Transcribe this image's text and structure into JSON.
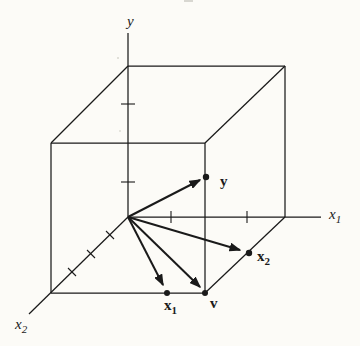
{
  "figure": {
    "name": "vectors-in-3d-cube-projection-figure",
    "background": "#fcfbf7",
    "ink": "#1a1a1a",
    "width": 360,
    "height": 346,
    "origin": {
      "x": 128,
      "y": 217
    },
    "axes": [
      {
        "name": "y-axis",
        "x1": 128,
        "y1": 217,
        "x2": 128,
        "y2": 33
      },
      {
        "name": "x1-axis",
        "x1": 128,
        "y1": 217,
        "x2": 321,
        "y2": 217
      },
      {
        "name": "x2-axis",
        "x1": 128,
        "y1": 217,
        "x2": 29,
        "y2": 314
      }
    ],
    "cube_edges": [
      {
        "name": "cube-back-top-edge",
        "x1": 128,
        "y1": 66,
        "x2": 285,
        "y2": 66
      },
      {
        "name": "cube-back-right-edge",
        "x1": 285,
        "y1": 66,
        "x2": 285,
        "y2": 217
      },
      {
        "name": "cube-top-left-receding-edge",
        "x1": 128,
        "y1": 66,
        "x2": 51,
        "y2": 143
      },
      {
        "name": "cube-top-right-receding-edge",
        "x1": 285,
        "y1": 66,
        "x2": 205,
        "y2": 143
      },
      {
        "name": "cube-front-top-edge",
        "x1": 51,
        "y1": 143,
        "x2": 205,
        "y2": 143
      },
      {
        "name": "cube-front-left-edge",
        "x1": 51,
        "y1": 143,
        "x2": 51,
        "y2": 293
      },
      {
        "name": "cube-front-right-edge",
        "x1": 205,
        "y1": 143,
        "x2": 205,
        "y2": 293
      },
      {
        "name": "cube-front-bottom-edge",
        "x1": 51,
        "y1": 293,
        "x2": 205,
        "y2": 293
      },
      {
        "name": "cube-bottom-right-receding-edge",
        "x1": 285,
        "y1": 217,
        "x2": 205,
        "y2": 293
      }
    ],
    "ticks": [
      {
        "name": "y-axis-tick-1",
        "x1": 121,
        "y1": 104,
        "x2": 135,
        "y2": 104
      },
      {
        "name": "y-axis-tick-2",
        "x1": 121,
        "y1": 182,
        "x2": 135,
        "y2": 182
      },
      {
        "name": "x1-axis-tick-1",
        "x1": 171,
        "y1": 211,
        "x2": 171,
        "y2": 223
      },
      {
        "name": "x1-axis-tick-2",
        "x1": 247,
        "y1": 211,
        "x2": 247,
        "y2": 223
      },
      {
        "name": "x2-axis-tick-1",
        "x1": 106,
        "y1": 231,
        "x2": 114,
        "y2": 239
      },
      {
        "name": "x2-axis-tick-2",
        "x1": 87,
        "y1": 250,
        "x2": 95,
        "y2": 258
      },
      {
        "name": "x2-axis-tick-3",
        "x1": 68,
        "y1": 268,
        "x2": 76,
        "y2": 276
      }
    ],
    "vectors": [
      {
        "name": "vector-to-y",
        "x1": 128,
        "y1": 217,
        "x2": 200,
        "y2": 180
      },
      {
        "name": "vector-to-x2",
        "x1": 128,
        "y1": 217,
        "x2": 240,
        "y2": 250
      },
      {
        "name": "vector-to-x1",
        "x1": 128,
        "y1": 217,
        "x2": 163,
        "y2": 285
      },
      {
        "name": "vector-to-v",
        "x1": 128,
        "y1": 217,
        "x2": 200,
        "y2": 287
      }
    ],
    "points": [
      {
        "name": "point-y",
        "x": 206,
        "y": 177,
        "r": 3.2
      },
      {
        "name": "point-x2",
        "x": 249,
        "y": 253,
        "r": 3.2
      },
      {
        "name": "point-x1",
        "x": 167,
        "y": 293,
        "r": 3.0
      },
      {
        "name": "point-v",
        "x": 205,
        "y": 293,
        "r": 3.0
      }
    ],
    "labels": [
      {
        "name": "y-axis-label",
        "text": "y",
        "sub": "",
        "x": 127,
        "y": 26,
        "style": "italic",
        "size": 15
      },
      {
        "name": "x1-axis-label",
        "text": "x",
        "sub": "1",
        "x": 329,
        "y": 219,
        "style": "italic",
        "size": 15
      },
      {
        "name": "x2-axis-label",
        "text": "x",
        "sub": "2",
        "x": 15,
        "y": 329,
        "style": "italic",
        "size": 15
      },
      {
        "name": "point-y-label",
        "text": "y",
        "sub": "",
        "x": 220,
        "y": 186,
        "style": "bold",
        "size": 15
      },
      {
        "name": "point-x2-label",
        "text": "x",
        "sub": "2",
        "x": 257,
        "y": 261,
        "style": "bold",
        "size": 15
      },
      {
        "name": "point-x1-label",
        "text": "x",
        "sub": "1",
        "x": 164,
        "y": 310,
        "style": "bold",
        "size": 15
      },
      {
        "name": "point-v-label",
        "text": "v",
        "sub": "",
        "x": 210,
        "y": 308,
        "style": "bold",
        "size": 15
      }
    ],
    "artifacts": [
      {
        "name": "scan-artifact-top",
        "x": 184,
        "y": 0,
        "w": 9,
        "h": 2,
        "color": "#c9c7c0"
      },
      {
        "name": "scan-artifact-speck-1",
        "x": 117,
        "y": 57,
        "w": 2,
        "h": 2,
        "color": "#d6d4cc"
      },
      {
        "name": "scan-artifact-speck-2",
        "x": 119,
        "y": 130,
        "w": 2,
        "h": 2,
        "color": "#dddbd3"
      }
    ],
    "stroke_widths": {
      "cube": 1.25,
      "axis": 1.25,
      "tick": 1.1,
      "vector": 2.0
    }
  }
}
